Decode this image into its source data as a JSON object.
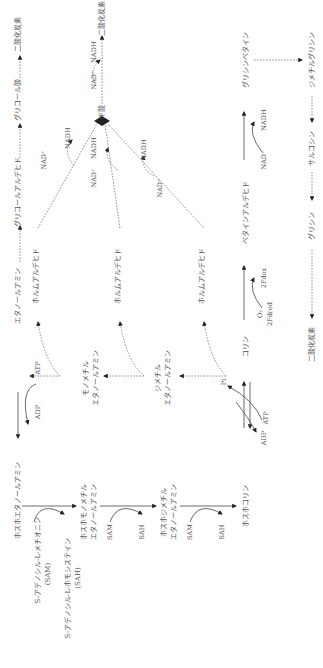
{
  "diagram": {
    "orientation": "rotated-90-ccw",
    "colors": {
      "line": "#444444",
      "text": "#555555",
      "arrowhead": "#222222"
    },
    "nodes": {
      "phosphoethanolamine": "ホスホエタノールアミン",
      "sam_full": "S-アデノシル-L-メチオニン",
      "sam_abbr": "(SAM)",
      "sah_full": "S-アデノシル-L-ホモシステイン",
      "sah_abbr": "(SAH)",
      "phosphomonomethylethanolamine_1": "ホスホモノメチル",
      "phosphomonomethylethanolamine_2": "エタノールアミン",
      "phosphodimethylethanolamine_1": "ホスホジメチル",
      "phosphodimethylethanolamine_2": "エタノールアミン",
      "phosphocholine": "ホスホコリン",
      "ethanolamine": "エタノールアミン",
      "monomethylethanolamine_1": "モノメチル",
      "monomethylethanolamine_2": "エタノールアミン",
      "dimethylethanolamine_1": "ジメチル",
      "dimethylethanolamine_2": "エタノールアミン",
      "choline": "コリン",
      "glycolaldehyde": "グリコールアルデヒド",
      "glycolic_acid": "グリコール酸",
      "co2_top": "二酸化炭素",
      "co2_formate": "二酸化炭素",
      "co2_bottom": "二酸化炭素",
      "formaldehyde_1": "ホルムアルデヒド",
      "formaldehyde_2": "ホルムアルデヒド",
      "formaldehyde_3": "ホルムアルデヒド",
      "formic_acid": "ギ酸",
      "betaine_aldehyde": "ベタインアルデヒド",
      "betaine": "ベタイン",
      "glycine_betaine": "グリシンベタイン",
      "glycine": "グリシン",
      "sarcosine": "サルコシン",
      "dimethylglycine": "ジメチルグリシン"
    },
    "cofactors": {
      "atp_1": "ATP",
      "adp_1": "ADP",
      "atp_2": "ATP",
      "adp_2": "ADP",
      "pi": "Pi",
      "sam_2": "SAM",
      "sah_2": "SAH",
      "sam_3": "SAM",
      "sah_3": "SAH",
      "nad_plus": "NAD⁺",
      "nadh": "NADH",
      "o2": "O₂",
      "fdred": "2Fdred",
      "fdox": "2Fdox"
    }
  }
}
